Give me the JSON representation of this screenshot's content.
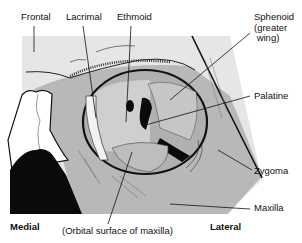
{
  "figure": {
    "type": "anatomical-diagram"
  },
  "labels": {
    "frontal": "Frontal",
    "lacrimal": "Lacrimal",
    "ethmoid": "Ethmoid",
    "sphenoid": "Sphenoid\n(greater\n wing)",
    "palatine": "Palatine",
    "zygoma": "Zygoma",
    "maxilla": "Maxilla",
    "orbital_surface": "(Orbital surface of maxilla)"
  },
  "orientation": {
    "medial": "Medial",
    "lateral": "Lateral"
  },
  "colors": {
    "background": "#ffffff",
    "light_gray": "#e4e4e4",
    "mid_gray": "#b4b4b4",
    "dark_gray": "#9a9a9a",
    "black": "#0a0a0a"
  }
}
